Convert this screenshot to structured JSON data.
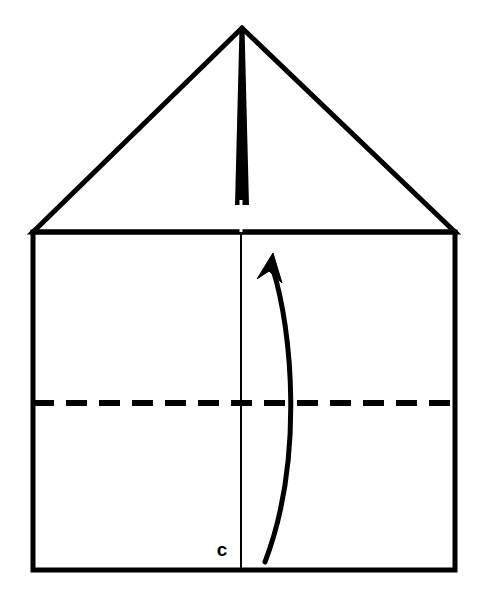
{
  "figure": {
    "type": "origami-fold-diagram",
    "background_color": "#ffffff",
    "ink_color": "#000000",
    "canvas": {
      "width": 488,
      "height": 606
    }
  },
  "labels": [
    {
      "id": "point-c",
      "text": "c",
      "x": 222,
      "y": 556,
      "style": "bold-lowercase"
    }
  ],
  "shapes": {
    "body_rectangle": {
      "name": "paper-body-rectangle",
      "left": 33,
      "top": 232,
      "right": 455,
      "bottom": 570,
      "stroke_width": 5,
      "fill": "none"
    },
    "left_flap_triangle": {
      "name": "left-folded-flap",
      "points": "242,28 33,232 242,232",
      "stroke_width": 5,
      "fill": "none"
    },
    "right_flap_triangle": {
      "name": "right-folded-flap",
      "points": "242,28 455,232 242,232",
      "stroke_width": 5,
      "fill": "none"
    },
    "center_thick_band": {
      "name": "center-thick-crease-band",
      "apex_x": 242,
      "apex_y": 28,
      "base_y": 205,
      "half_width_at_base": 7,
      "fill": "#000000"
    },
    "center_slot_notch": {
      "name": "center-slot-notch",
      "x": 241,
      "top": 200,
      "bottom": 232,
      "width": 3,
      "fill": "#ffffff"
    },
    "center_vertical_line": {
      "name": "center-vertical-crease-line",
      "x": 241,
      "top": 232,
      "bottom": 570,
      "stroke_width": 2
    },
    "horizontal_dashed_fold": {
      "name": "horizontal-dashed-fold-line",
      "y": 403,
      "left": 33,
      "right": 455,
      "stroke_width": 6,
      "dash": 21,
      "gap": 12
    },
    "curved_arrow": {
      "name": "fold-direction-curved-arrow",
      "tail_x": 265,
      "tail_y": 562,
      "tip_x": 273,
      "tip_y": 253,
      "control1_x": 304,
      "control1_y": 460,
      "control2_x": 292,
      "control2_y": 330,
      "stroke_width": 5,
      "head_length": 30,
      "head_width": 20
    }
  }
}
